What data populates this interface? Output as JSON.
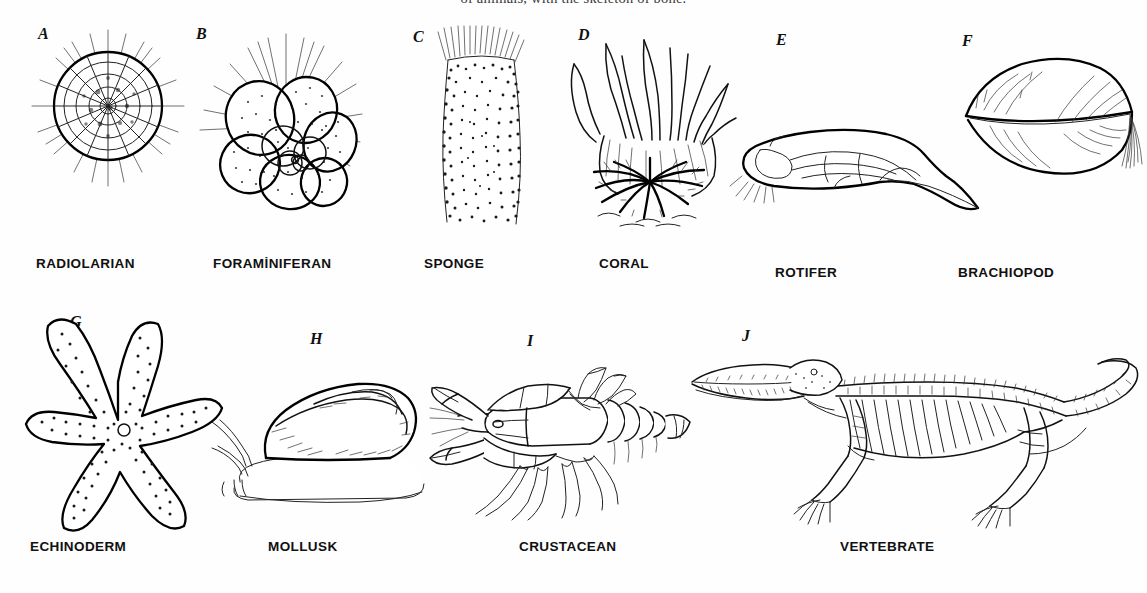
{
  "figure": {
    "caption_top": "of animals, with the skeleton of bone.",
    "background_color": "#fefefe",
    "ink_color": "#111111",
    "rows": 2,
    "columns_row1": 6,
    "columns_row2": 4
  },
  "specimens": [
    {
      "letter": "A",
      "label": "RADIOLARIAN",
      "art_name": "radiolarian-drawing",
      "description": "spherical latticed shell with radiating spines"
    },
    {
      "letter": "B",
      "label": "FORAMİNIFERAN",
      "art_name": "foraminiferan-drawing",
      "description": "spiral of stippled chambers with radiating spines"
    },
    {
      "letter": "C",
      "label": "SPONGE",
      "art_name": "sponge-drawing",
      "description": "vase-shaped stippled body with apical spicules"
    },
    {
      "letter": "D",
      "label": "CORAL",
      "art_name": "coral-drawing",
      "description": "polyp with tentacles above a radial calyx"
    },
    {
      "letter": "E",
      "label": "ROTIFER",
      "art_name": "rotifer-drawing",
      "description": "elongate body with internal organs and tapering foot"
    },
    {
      "letter": "F",
      "label": "BRACHIOPOD",
      "art_name": "brachiopod-drawing",
      "description": "two valves with pedicle fibre tuft"
    },
    {
      "letter": "G",
      "label": "ECHINODERM",
      "art_name": "echinoderm-drawing",
      "description": "five-armed stippled sea star with madreporite"
    },
    {
      "letter": "H",
      "label": "MOLLUSK",
      "art_name": "mollusk-drawing",
      "description": "snail with conical spiral shell and tentacles"
    },
    {
      "letter": "I",
      "label": "CRUSTACEAN",
      "art_name": "crustacean-drawing",
      "description": "crayfish with chelae, segmented abdomen and tail fan"
    },
    {
      "letter": "J",
      "label": "VERTEBRATE",
      "art_name": "vertebrate-drawing",
      "description": "crocodilian skeleton with skull, ribs, limbs and tail"
    }
  ]
}
